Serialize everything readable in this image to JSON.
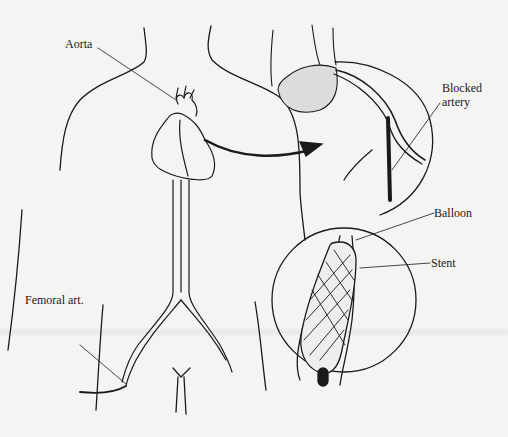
{
  "figure": {
    "labels": {
      "aorta": "Aorta",
      "blocked_artery_line1": "Blocked",
      "blocked_artery_line2": "artery",
      "balloon": "Balloon",
      "stent": "Stent",
      "femoral": "Femoral art."
    },
    "colors": {
      "ink": "#1a1a1a",
      "paper": "#f4f4f2"
    }
  }
}
